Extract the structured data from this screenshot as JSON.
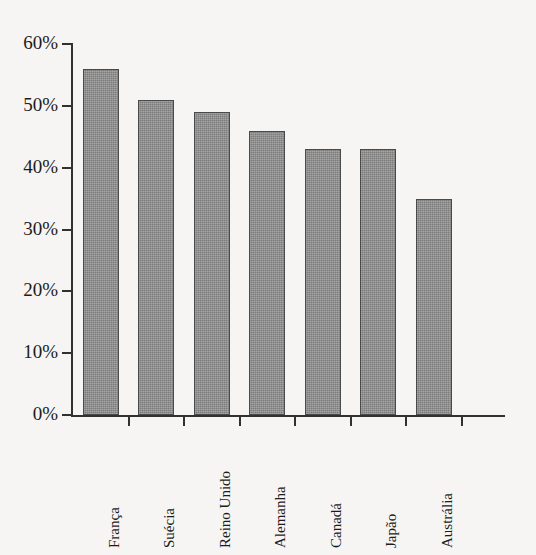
{
  "chart_data": {
    "type": "bar",
    "title": "",
    "xlabel": "",
    "ylabel": "",
    "categories": [
      "França",
      "Suécia",
      "Reino Unido",
      "Alemanha",
      "Canadá",
      "Japão",
      "Austrália"
    ],
    "values": [
      56,
      51,
      49,
      46,
      43,
      43,
      35
    ],
    "value_suffix": "%",
    "ylim": [
      0,
      60
    ],
    "ytick_labels": [
      "60%",
      "50%",
      "40%",
      "30%",
      "20%",
      "10%",
      "0%"
    ],
    "ytick_values": [
      60,
      50,
      40,
      30,
      20,
      10,
      0
    ],
    "grid": false,
    "legend": null,
    "bar_color": "#8b8b8b",
    "bar_border_color": "#4a4a4a",
    "axis_color": "#32312f",
    "background_color": "#f6f5f3"
  }
}
